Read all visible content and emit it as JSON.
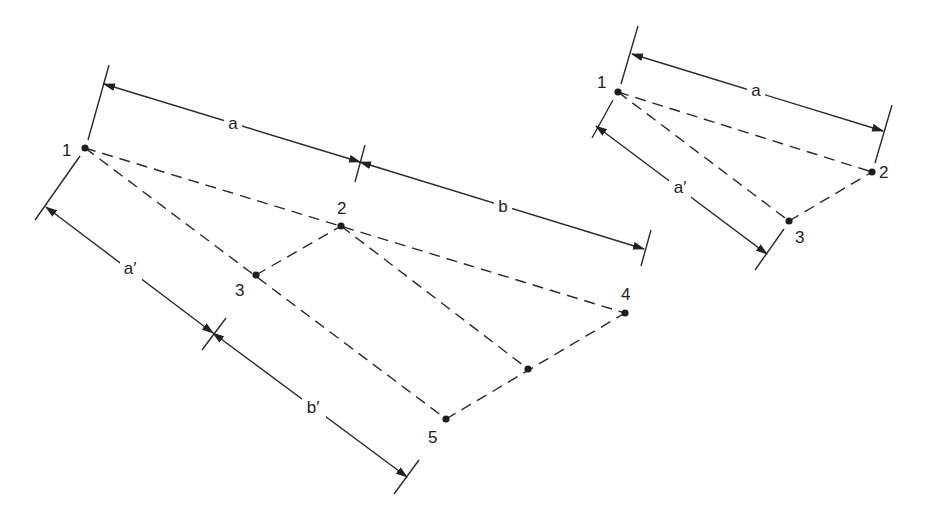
{
  "figure": {
    "left_diagram": {
      "points": [
        {
          "label": "1",
          "x": 85,
          "y": 148,
          "lx": 62,
          "ly": 156
        },
        {
          "label": "2",
          "x": 341,
          "y": 226,
          "lx": 337,
          "ly": 214
        },
        {
          "label": "3",
          "x": 256,
          "y": 275,
          "lx": 235,
          "ly": 296
        },
        {
          "label": "4",
          "x": 625,
          "y": 313,
          "lx": 621,
          "ly": 300
        },
        {
          "label": "",
          "x": 528,
          "y": 369,
          "lx": 0,
          "ly": 0
        },
        {
          "label": "5",
          "x": 446,
          "y": 419,
          "lx": 428,
          "ly": 443
        }
      ],
      "dimensions": {
        "a": "a",
        "b": "b",
        "a_prime": "a′",
        "b_prime": "b′"
      }
    },
    "right_diagram": {
      "points": [
        {
          "label": "1",
          "x": 618,
          "y": 92,
          "lx": 597,
          "ly": 88
        },
        {
          "label": "2",
          "x": 872,
          "y": 172,
          "lx": 879,
          "ly": 178
        },
        {
          "label": "3",
          "x": 789,
          "y": 221,
          "lx": 795,
          "ly": 243
        }
      ],
      "dimensions": {
        "a": "a",
        "a_prime": "a′"
      }
    }
  }
}
